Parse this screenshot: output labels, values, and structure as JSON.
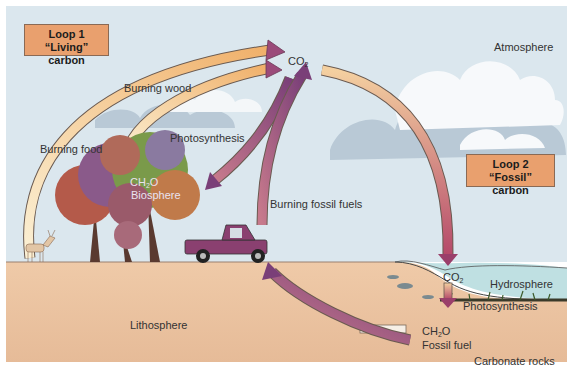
{
  "loops": {
    "loop1": {
      "title": "Loop 1",
      "subtitle": "“Living” carbon"
    },
    "loop2": {
      "title": "Loop 2",
      "subtitle": "“Fossil” carbon"
    }
  },
  "labels": {
    "co2_atmosphere": "CO",
    "co2_atmosphere_sub": "2",
    "atmosphere": "Atmosphere",
    "burning_wood": "Burning wood",
    "burning_food": "Burning food",
    "photosynthesis_land": "Photosynthesis",
    "biosphere_formula": "CH",
    "biosphere_formula_sub": "2",
    "biosphere_formula_tail": "O",
    "biosphere": "Biosphere",
    "burning_fossil_fuels": "Burning fossil fuels",
    "co2_water": "CO",
    "co2_water_sub": "2",
    "hydrosphere": "Hydrosphere",
    "photosynthesis_water": "Photosynthesis",
    "fossil_formula": "CH",
    "fossil_formula_sub": "2",
    "fossil_formula_tail": "O",
    "fossil_fuel": "Fossil fuel",
    "lithosphere": "Lithosphere",
    "carbonate_rocks": "Carbonate rocks"
  },
  "colors": {
    "sky": "#dbe7ee",
    "cloud": "#f7f9fb",
    "cloud_shadow": "#b9c9d6",
    "ground": "#ecc7a6",
    "water": "#bfe0e2",
    "label_box": "#e9a06e",
    "arrow_dark": "#8a4b7a",
    "arrow_light": "#f2c27a"
  }
}
